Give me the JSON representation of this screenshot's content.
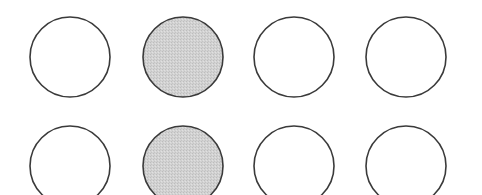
{
  "diagram": {
    "type": "circle-grid",
    "rows": 2,
    "columns": 4,
    "circle_radius": 40,
    "stroke_color": "#3a3a3a",
    "stroke_width": 1.6,
    "empty_fill": "#ffffff",
    "shaded_fill": "#cfcfcf",
    "column_centers_x": [
      70,
      183,
      294,
      406
    ],
    "row_centers_y": [
      57,
      166
    ],
    "circles": [
      {
        "row": 0,
        "col": 0,
        "shaded": false
      },
      {
        "row": 0,
        "col": 1,
        "shaded": true
      },
      {
        "row": 0,
        "col": 2,
        "shaded": false
      },
      {
        "row": 0,
        "col": 3,
        "shaded": false
      },
      {
        "row": 1,
        "col": 0,
        "shaded": false
      },
      {
        "row": 1,
        "col": 1,
        "shaded": true
      },
      {
        "row": 1,
        "col": 2,
        "shaded": false
      },
      {
        "row": 1,
        "col": 3,
        "shaded": false
      }
    ]
  }
}
